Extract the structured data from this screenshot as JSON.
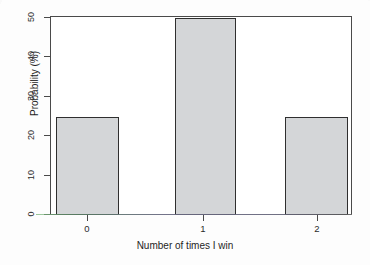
{
  "chart_data": {
    "type": "bar",
    "title": "",
    "xlabel": "Number of times I win",
    "ylabel": "Probability (%)",
    "categories": [
      "0",
      "1",
      "2"
    ],
    "values": [
      25,
      50,
      25
    ],
    "ylim": [
      0,
      50
    ],
    "yticks": [
      0,
      10,
      20,
      30,
      40,
      50
    ],
    "ytick_labels": [
      "0",
      "10",
      "20",
      "30",
      "40",
      "50"
    ],
    "xticks": [
      0,
      1,
      2
    ],
    "xtick_labels": [
      "0",
      "1",
      "2"
    ],
    "grid": false,
    "legend": null,
    "bar_fill_color": "#d4d6d8",
    "bar_edge_color": "#2f2f2f",
    "axis_color": "#4a4a4a",
    "background_color": "#ffffff"
  },
  "axis": {
    "y_title": "Probability (%)",
    "x_title": "Number of times I win"
  },
  "yticks": {
    "t0": "0",
    "t1": "10",
    "t2": "20",
    "t3": "30",
    "t4": "40",
    "t5": "50"
  },
  "xticks": {
    "t0": "0",
    "t1": "1",
    "t2": "2"
  }
}
